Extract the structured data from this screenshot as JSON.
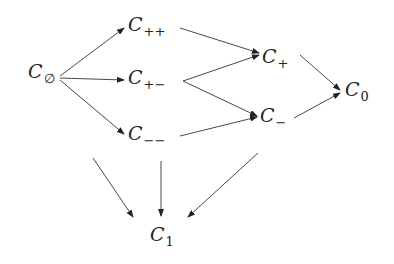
{
  "diagram": {
    "nodes": [
      {
        "id": "empty",
        "base": "C",
        "sub": "∅",
        "x": 28,
        "y": 62
      },
      {
        "id": "pp",
        "base": "C",
        "sub": "++",
        "x": 128,
        "y": 15
      },
      {
        "id": "pm",
        "base": "C",
        "sub": "+−",
        "x": 128,
        "y": 68
      },
      {
        "id": "mm",
        "base": "C",
        "sub": "−−",
        "x": 128,
        "y": 124
      },
      {
        "id": "p",
        "base": "C",
        "sub": "+",
        "x": 262,
        "y": 47
      },
      {
        "id": "m",
        "base": "C",
        "sub": "−",
        "x": 260,
        "y": 106
      },
      {
        "id": "zero",
        "base": "C",
        "sub": "0",
        "x": 345,
        "y": 80
      },
      {
        "id": "one",
        "base": "C",
        "sub": "1",
        "x": 150,
        "y": 225
      }
    ],
    "edges": [
      {
        "from": "C∅",
        "to": "C++"
      },
      {
        "from": "C∅",
        "to": "C+−"
      },
      {
        "from": "C∅",
        "to": "C−−"
      },
      {
        "from": "C++",
        "to": "C+"
      },
      {
        "from": "C+−",
        "to": "C+"
      },
      {
        "from": "C+−",
        "to": "C−"
      },
      {
        "from": "C−−",
        "to": "C−"
      },
      {
        "from": "C+",
        "to": "C0"
      },
      {
        "from": "C−",
        "to": "C0"
      },
      {
        "from": "(unlabeled)",
        "to": "C1"
      },
      {
        "from": "C−−",
        "to": "C1"
      },
      {
        "from": "(unlabeled)",
        "to": "C1"
      }
    ]
  }
}
